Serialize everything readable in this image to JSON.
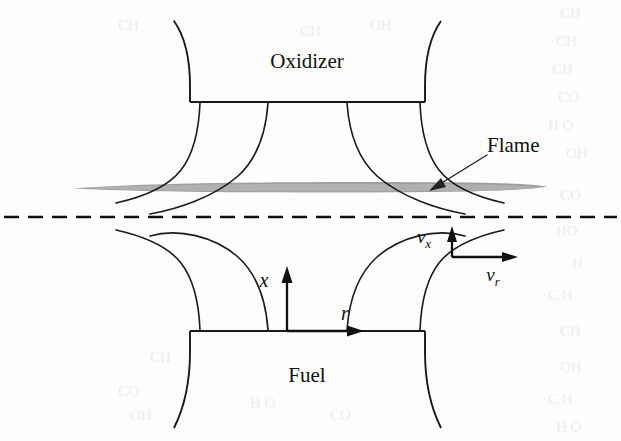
{
  "figure": {
    "canvas": {
      "width": 621,
      "height": 441
    },
    "background_color": "#fdfdfc",
    "ink_color": "#1a1a1a",
    "flame_color": "#9d9d9d"
  },
  "labels": {
    "oxidizer": "Oxidizer",
    "fuel": "Fuel",
    "flame": "Flame",
    "axis_x": "x",
    "axis_r": "r",
    "velocity_x_base": "v",
    "velocity_x_sub": "x",
    "velocity_r_base": "v",
    "velocity_r_sub": "r"
  },
  "geometry": {
    "oxidizer_nozzle": {
      "exit_line_y": 102,
      "exit_left_x": 190,
      "exit_right_x": 425,
      "wall_flare": "outward toward top of frame"
    },
    "fuel_nozzle": {
      "exit_line_y": 331,
      "exit_left_x": 190,
      "exit_right_x": 425,
      "wall_flare": "outward toward bottom of frame"
    },
    "flame_sheet": {
      "center_y": 188,
      "left_x": 74,
      "right_x": 547,
      "max_thickness": 9,
      "shape": "thin horizontal lens"
    },
    "centerline": {
      "y": 217,
      "x_start": 6,
      "x_end": 615,
      "style": "dashed",
      "meaning": "stagnation plane / symmetry axis"
    },
    "oxidizer_streamline_origins_x": [
      200,
      268,
      347,
      420
    ],
    "fuel_streamline_origins_x": [
      200,
      268,
      347,
      420
    ]
  },
  "annotations": {
    "flame_leader": {
      "from_x": 487,
      "from_y": 155,
      "to_x": 432,
      "to_y": 188,
      "arrowhead": true
    },
    "axis_origin": {
      "x": 287,
      "y": 331
    },
    "velocity_origin": {
      "x": 452,
      "y": 257
    }
  },
  "bleed_through_text": [
    "CH",
    "CH",
    "CH",
    "CO",
    "H O",
    "OH",
    "CO",
    "HO",
    "H",
    "C H",
    "CH",
    "OH",
    "C H",
    "H O",
    "CO",
    "CH",
    "H",
    "OH"
  ]
}
